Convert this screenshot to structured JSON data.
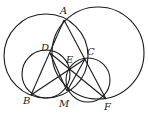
{
  "figure": {
    "type": "geometry-diagram",
    "points": [
      {
        "label": "A",
        "x": 64,
        "y": 20,
        "lx": 60,
        "ly": 14
      },
      {
        "label": "D",
        "x": 50,
        "y": 53,
        "lx": 41,
        "ly": 51
      },
      {
        "label": "C",
        "x": 85,
        "y": 59,
        "lx": 87,
        "ly": 55
      },
      {
        "label": "E",
        "x": 69,
        "y": 68,
        "lx": 66,
        "ly": 63
      },
      {
        "label": "B",
        "x": 31,
        "y": 95,
        "lx": 23,
        "ly": 104
      },
      {
        "label": "M",
        "x": 67,
        "y": 91,
        "lx": 59,
        "ly": 107
      },
      {
        "label": "F",
        "x": 106,
        "y": 99,
        "lx": 104,
        "ly": 110
      }
    ],
    "circles": [
      {
        "name": "circle-ABC",
        "cx": 46,
        "cy": 56,
        "r": 42
      },
      {
        "name": "circle-AF",
        "cx": 98,
        "cy": 53,
        "r": 46
      },
      {
        "name": "circle-DBME",
        "cx": 46,
        "cy": 74,
        "r": 24
      },
      {
        "name": "circle-CEMF",
        "cx": 88,
        "cy": 80,
        "r": 22
      }
    ],
    "segments": [
      {
        "name": "segment-AB",
        "from": "A",
        "to": "B"
      },
      {
        "name": "segment-AF",
        "from": "A",
        "to": "F"
      },
      {
        "name": "segment-DF",
        "from": "D",
        "to": "F"
      },
      {
        "name": "segment-BC",
        "from": "B",
        "to": "C"
      },
      {
        "name": "segment-DM",
        "from": "D",
        "to": "M"
      },
      {
        "name": "segment-CM",
        "from": "C",
        "to": "M"
      }
    ]
  }
}
